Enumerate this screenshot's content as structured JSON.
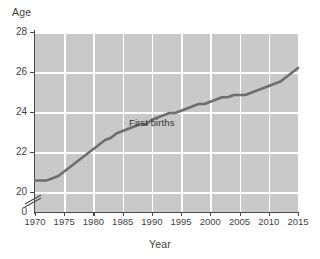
{
  "chart_data": {
    "type": "line",
    "title": "",
    "xlabel": "Year",
    "ylabel": "Age",
    "xlim": [
      1970,
      2015
    ],
    "ylim": [
      20,
      28
    ],
    "y_axis_break": true,
    "y_axis_break_symbol": "//",
    "grid": true,
    "legend": "none",
    "xticks": [
      1970,
      1975,
      1980,
      1985,
      1990,
      1995,
      2000,
      2005,
      2010,
      2015
    ],
    "yticks": [
      0,
      20,
      22,
      24,
      26,
      28
    ],
    "series": [
      {
        "name": "First births",
        "color": "#6e6e6e",
        "annotation": "First births",
        "x": [
          1970,
          1971,
          1972,
          1973,
          1974,
          1975,
          1976,
          1977,
          1978,
          1979,
          1980,
          1981,
          1982,
          1983,
          1984,
          1985,
          1986,
          1987,
          1988,
          1989,
          1990,
          1991,
          1992,
          1993,
          1994,
          1995,
          1996,
          1997,
          1998,
          1999,
          2000,
          2001,
          2002,
          2003,
          2004,
          2005,
          2006,
          2007,
          2008,
          2009,
          2010,
          2011,
          2012,
          2013,
          2014,
          2015
        ],
        "values": [
          21.4,
          21.4,
          21.4,
          21.5,
          21.6,
          21.8,
          22.0,
          22.2,
          22.4,
          22.6,
          22.8,
          23.0,
          23.2,
          23.3,
          23.5,
          23.6,
          23.7,
          23.8,
          23.9,
          23.9,
          24.1,
          24.2,
          24.3,
          24.4,
          24.4,
          24.5,
          24.6,
          24.7,
          24.8,
          24.8,
          24.9,
          25.0,
          25.1,
          25.1,
          25.2,
          25.2,
          25.2,
          25.3,
          25.4,
          25.5,
          25.6,
          25.7,
          25.8,
          26.0,
          26.2,
          26.4
        ]
      }
    ]
  },
  "labels": {
    "y_axis_title": "Age",
    "x_axis_title": "Year",
    "y_tick_28": "28",
    "y_tick_26": "26",
    "y_tick_24": "24",
    "y_tick_22": "22",
    "y_tick_20": "20",
    "y_tick_0": "0",
    "x_tick_1970": "1970",
    "x_tick_1975": "1975",
    "x_tick_1980": "1980",
    "x_tick_1985": "1985",
    "x_tick_1990": "1990",
    "x_tick_1995": "1995",
    "x_tick_2000": "2000",
    "x_tick_2005": "2005",
    "x_tick_2010": "2010",
    "x_tick_2015": "2015",
    "annotation_first_births": "First births"
  },
  "colors": {
    "plot_background": "#c9c9c9",
    "gridline": "#ffffff",
    "series_line": "#6e6e6e",
    "axis": "#4a4a4a",
    "text": "#3f3f3f"
  }
}
